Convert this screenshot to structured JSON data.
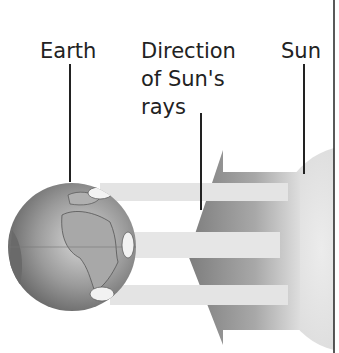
{
  "diagram": {
    "labels": {
      "earth": "Earth",
      "rays_line1": "Direction",
      "rays_line2": "of Sun's",
      "rays_line3": "rays",
      "sun": "Sun"
    },
    "elements": [
      "earth-globe",
      "sun-disc",
      "sun-rays-arrow",
      "light-beams"
    ],
    "colors": {
      "background": "#ffffff",
      "text": "#222222",
      "sun": "#e2e2e2",
      "arrow_dark": "#8a8a8a",
      "beams": "#e6e6e6",
      "earth": "#8c8c8c"
    }
  }
}
